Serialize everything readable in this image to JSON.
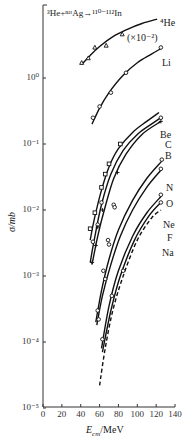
{
  "chart_data": {
    "type": "line",
    "title": "³He+ⁿᵃᵗAg→¹¹⁰⁻¹¹²In",
    "xlabel": "E_cm/MeV",
    "ylabel": "σ/mb",
    "xlim": [
      0,
      140
    ],
    "ylim": [
      1e-05,
      10
    ],
    "yscale": "log",
    "grid": false,
    "x_ticks": [
      "0",
      "20",
      "40",
      "60",
      "80",
      "100",
      "120",
      "140"
    ],
    "y_ticks": [
      "10⁻⁵",
      "10⁻⁴",
      "10⁻³",
      "10⁻²",
      "10⁻¹",
      "10⁰"
    ],
    "series": [
      {
        "name": "⁴He",
        "note": "(×10⁻²)",
        "marker": "triangle",
        "curve": [
          [
            41,
            1.6
          ],
          [
            50,
            2.2
          ],
          [
            60,
            3.0
          ],
          [
            75,
            4.3
          ],
          [
            90,
            5.5
          ],
          [
            105,
            6.7
          ],
          [
            121,
            7.8
          ]
        ],
        "points": [
          [
            41,
            1.7
          ],
          [
            48,
            2.0
          ],
          [
            55,
            2.9
          ],
          [
            67,
            3.1
          ],
          [
            84,
            4.6
          ]
        ]
      },
      {
        "name": "Li",
        "marker": "circle",
        "curve": [
          [
            52,
            0.2
          ],
          [
            60,
            0.35
          ],
          [
            70,
            0.6
          ],
          [
            85,
            1.1
          ],
          [
            100,
            1.7
          ],
          [
            115,
            2.3
          ],
          [
            125,
            2.8
          ]
        ],
        "points": [
          [
            53,
            0.25
          ],
          [
            60,
            0.37
          ],
          [
            72,
            0.6
          ],
          [
            88,
            1.2
          ],
          [
            125,
            2.9
          ]
        ]
      },
      {
        "name": "Be",
        "marker": "square",
        "curve": [
          [
            50,
            0.0035
          ],
          [
            55,
            0.008
          ],
          [
            62,
            0.02
          ],
          [
            70,
            0.045
          ],
          [
            80,
            0.085
          ],
          [
            95,
            0.15
          ],
          [
            110,
            0.22
          ],
          [
            123,
            0.3
          ]
        ],
        "points": [
          [
            50,
            0.0052
          ],
          [
            55,
            0.0091
          ],
          [
            62,
            0.022
          ],
          [
            66,
            0.035
          ],
          [
            70,
            0.05
          ],
          [
            82,
            0.1
          ]
        ]
      },
      {
        "name": "C",
        "marker": "circle",
        "curve": [
          [
            50,
            0.0016
          ],
          [
            55,
            0.004
          ],
          [
            62,
            0.012
          ],
          [
            72,
            0.035
          ],
          [
            85,
            0.08
          ],
          [
            100,
            0.14
          ],
          [
            115,
            0.2
          ],
          [
            125,
            0.25
          ]
        ],
        "points": [
          [
            53,
            0.0033
          ],
          [
            58,
            0.006
          ],
          [
            62,
            0.013
          ],
          [
            125,
            0.25
          ]
        ]
      },
      {
        "name": "B",
        "marker": "plus",
        "curve": [
          [
            52,
            0.0015
          ],
          [
            58,
            0.004
          ],
          [
            65,
            0.01
          ],
          [
            75,
            0.03
          ],
          [
            88,
            0.07
          ],
          [
            105,
            0.14
          ],
          [
            125,
            0.22
          ]
        ],
        "points": [
          [
            52,
            0.0016
          ],
          [
            56,
            0.0029
          ],
          [
            58,
            0.0055
          ],
          [
            63,
            0.01
          ],
          [
            79,
            0.037
          ],
          [
            125,
            0.22
          ]
        ]
      },
      {
        "name": "N",
        "marker": "circle",
        "curve": [
          [
            56,
            0.0002
          ],
          [
            62,
            0.0006
          ],
          [
            70,
            0.0018
          ],
          [
            80,
            0.005
          ],
          [
            95,
            0.014
          ],
          [
            110,
            0.03
          ],
          [
            126,
            0.055
          ]
        ],
        "points": [
          [
            58,
            0.0003
          ],
          [
            64,
            0.0012
          ],
          [
            69,
            0.0035
          ],
          [
            75,
            0.012
          ],
          [
            126,
            0.058
          ]
        ]
      },
      {
        "name": "O",
        "marker": "circle",
        "curve": [
          [
            57,
            0.00018
          ],
          [
            63,
            0.0005
          ],
          [
            72,
            0.0015
          ],
          [
            82,
            0.004
          ],
          [
            95,
            0.01
          ],
          [
            110,
            0.022
          ],
          [
            125,
            0.04
          ]
        ],
        "points": [
          [
            59,
            0.00022
          ],
          [
            66,
            0.0009
          ],
          [
            70,
            0.003
          ],
          [
            76,
            0.011
          ],
          [
            125,
            0.042
          ]
        ]
      },
      {
        "name": "Ne",
        "marker": "circle",
        "curve": [
          [
            62,
            8e-05
          ],
          [
            70,
            0.00035
          ],
          [
            80,
            0.0012
          ],
          [
            95,
            0.004
          ],
          [
            110,
            0.009
          ],
          [
            125,
            0.016
          ]
        ],
        "points": [
          [
            63,
            0.00011
          ],
          [
            73,
            0.0005
          ],
          [
            85,
            0.0012
          ],
          [
            125,
            0.017
          ]
        ]
      },
      {
        "name": "F",
        "marker": "circle",
        "curve": [
          [
            63,
            7e-05
          ],
          [
            72,
            0.0003
          ],
          [
            82,
            0.001
          ],
          [
            97,
            0.0035
          ],
          [
            112,
            0.008
          ],
          [
            125,
            0.013
          ]
        ],
        "points": [
          [
            125,
            0.013
          ]
        ]
      },
      {
        "name": "Na",
        "marker": "none",
        "dashed": true,
        "curve": [
          [
            60,
            2.2e-05
          ],
          [
            66,
            8e-05
          ],
          [
            74,
            0.0003
          ],
          [
            85,
            0.001
          ],
          [
            100,
            0.0035
          ],
          [
            115,
            0.0075
          ],
          [
            125,
            0.01
          ]
        ],
        "points": [
          [
            125,
            0.0105
          ]
        ]
      }
    ],
    "labels": [
      {
        "text": "⁴He",
        "x": 160,
        "y": 18
      },
      {
        "text": "(×10⁻²)",
        "x": 127,
        "y": 33
      },
      {
        "text": "Li",
        "x": 162,
        "y": 58
      },
      {
        "text": "Be",
        "x": 160,
        "y": 130
      },
      {
        "text": "C",
        "x": 165,
        "y": 140
      },
      {
        "text": "B",
        "x": 165,
        "y": 151
      },
      {
        "text": "N",
        "x": 166,
        "y": 183
      },
      {
        "text": "O",
        "x": 166,
        "y": 199
      },
      {
        "text": "Ne",
        "x": 163,
        "y": 220
      },
      {
        "text": "F",
        "x": 167,
        "y": 233
      },
      {
        "text": "Na",
        "x": 162,
        "y": 248
      }
    ]
  }
}
